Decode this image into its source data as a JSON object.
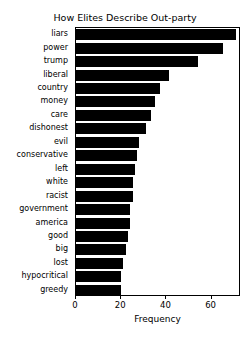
{
  "chart_data": {
    "type": "bar",
    "orientation": "horizontal",
    "title": "How Elites Describe Out-party",
    "xlabel": "Frequency",
    "ylabel": "",
    "xlim": [
      0,
      73
    ],
    "xticks": [
      0,
      20,
      40,
      60
    ],
    "xtick_labels": [
      "0",
      "20",
      "40",
      "60"
    ],
    "grid": false,
    "legend": null,
    "bar_color": "#000000",
    "background_color": "#ffffff",
    "categories": [
      "liars",
      "power",
      "trump",
      "liberal",
      "country",
      "money",
      "care",
      "dishonest",
      "evil",
      "conservative",
      "left",
      "white",
      "racist",
      "government",
      "america",
      "good",
      "big",
      "lost",
      "hypocritical",
      "greedy"
    ],
    "values": [
      71,
      65,
      54,
      41,
      37,
      35,
      33,
      31,
      28,
      27,
      26,
      25,
      25,
      24,
      24,
      23,
      22,
      21,
      20,
      20
    ]
  }
}
